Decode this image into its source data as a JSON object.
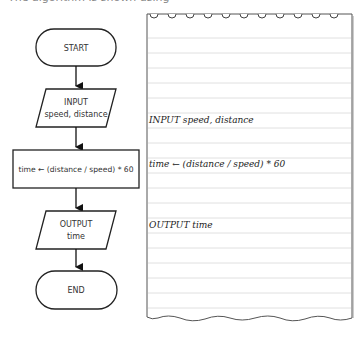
{
  "header": {
    "partial_text": "The algorithm is shown using"
  },
  "flowchart": {
    "start": "START",
    "input_label": "INPUT",
    "input_vars": "speed, distance",
    "process": "time ← (distance / speed) * 60",
    "output_label": "OUTPUT",
    "output_vars": "time",
    "end": "END"
  },
  "pseudocode": {
    "lines": [
      "INPUT speed, distance",
      "time ← (distance / speed) * 60",
      "OUTPUT time"
    ]
  },
  "colors": {
    "stroke": "#222222",
    "ruled_line": "#d8d8d8",
    "paper": "#ffffff"
  }
}
